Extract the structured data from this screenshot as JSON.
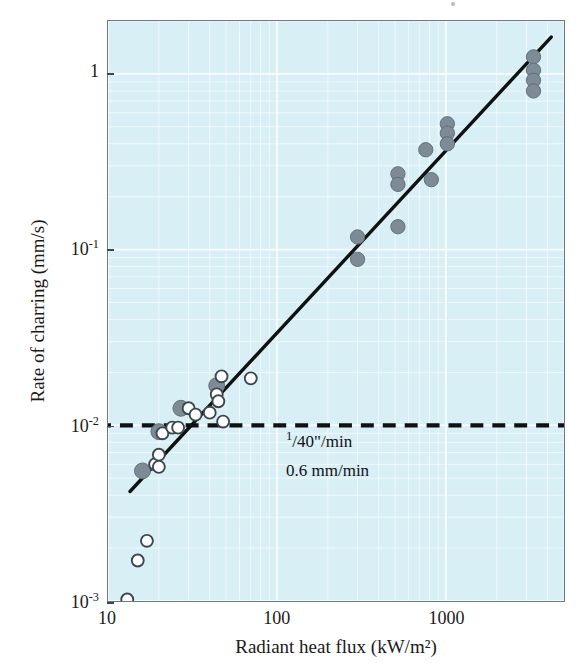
{
  "figure": {
    "background_color": "#ffffff",
    "plot_background_color": "#d8eff6",
    "frame_color": "#6b7a85",
    "grid_color": "#ffffff",
    "trend_line_color": "#111111",
    "reference_line_color": "#111111",
    "filled_marker_color": "#7d8b96",
    "open_marker_color": "#ffffff",
    "open_marker_edge_color": "#3b4750"
  },
  "chart_data": {
    "type": "scatter",
    "title": "",
    "xlabel": "Radiant heat flux (kW/m²)",
    "ylabel": "Rate of charring (mm/s)",
    "xscale": "log",
    "yscale": "log",
    "xlim": [
      10,
      5000
    ],
    "ylim": [
      0.001,
      2.0
    ],
    "grid": true,
    "grid_style": "log-minor",
    "legend": null,
    "xticks": [
      {
        "value": 10,
        "label": "10"
      },
      {
        "value": 100,
        "label": "100"
      },
      {
        "value": 1000,
        "label": "1000"
      }
    ],
    "yticks": [
      {
        "value": 1,
        "label": "1",
        "sup": ""
      },
      {
        "value": 0.1,
        "label": "10",
        "sup": "-1"
      },
      {
        "value": 0.01,
        "label": "10",
        "sup": "-2"
      },
      {
        "value": 0.001,
        "label": "10",
        "sup": "-3"
      }
    ],
    "series": [
      {
        "name": "filled markers",
        "marker": "filled-circle",
        "color": "#7d8b96",
        "points": [
          [
            16,
            0.0055
          ],
          [
            20,
            0.0092
          ],
          [
            27,
            0.0125
          ],
          [
            44,
            0.0168
          ],
          [
            300,
            0.118
          ],
          [
            300,
            0.088
          ],
          [
            520,
            0.27
          ],
          [
            520,
            0.235
          ],
          [
            520,
            0.135
          ],
          [
            760,
            0.37
          ],
          [
            820,
            0.25
          ],
          [
            1020,
            0.52
          ],
          [
            1020,
            0.46
          ],
          [
            1020,
            0.4
          ],
          [
            3300,
            1.25
          ],
          [
            3300,
            1.05
          ],
          [
            3300,
            0.92
          ],
          [
            3300,
            0.8
          ]
        ]
      },
      {
        "name": "open markers",
        "marker": "open-circle",
        "color": "#ffffff",
        "points": [
          [
            13,
            0.00102
          ],
          [
            15,
            0.0017
          ],
          [
            17,
            0.0022
          ],
          [
            19,
            0.006
          ],
          [
            20,
            0.0068
          ],
          [
            20,
            0.0058
          ],
          [
            21,
            0.009
          ],
          [
            24,
            0.0097
          ],
          [
            26,
            0.0097
          ],
          [
            30,
            0.0125
          ],
          [
            33,
            0.0115
          ],
          [
            40,
            0.0118
          ],
          [
            44,
            0.015
          ],
          [
            45,
            0.0137
          ],
          [
            47,
            0.019
          ],
          [
            48,
            0.0105
          ],
          [
            70,
            0.0185
          ]
        ]
      }
    ],
    "trend_line": {
      "label": "best fit",
      "x_start": 13.5,
      "y_start": 0.0042,
      "x_end": 4200,
      "y_end": 1.62
    },
    "reference_line": {
      "style": "dashed",
      "y_value": 0.01,
      "label_upper": "1/40\"/min",
      "label_upper_numerator": "1",
      "label_upper_rest": "/40\"/min",
      "label_lower": "0.6 mm/min"
    }
  },
  "annotations": {
    "upper_numerator": "1",
    "upper_rest": "/40\"/min",
    "lower": "0.6 mm/min"
  }
}
